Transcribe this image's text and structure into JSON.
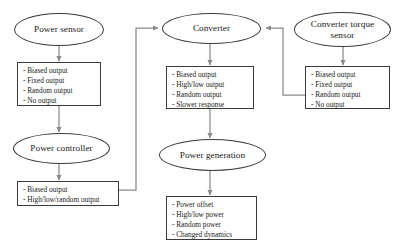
{
  "diagram": {
    "background": "#ffffff",
    "line_color": "#7a7a7a",
    "stroke_color": "#3a3a3a",
    "text_color": "#1a1a1a"
  },
  "nodes": {
    "power_sensor": {
      "label": "Power sensor"
    },
    "converter": {
      "label": "Converter"
    },
    "converter_torque_sensor": {
      "label": "Converter torque\nsensor",
      "line1": "Converter torque",
      "line2": "sensor"
    },
    "power_controller": {
      "label": "Power controller"
    },
    "power_generation": {
      "label": "Power generation"
    }
  },
  "boxes": {
    "power_sensor_faults": {
      "items": [
        "- Biased output",
        "- Fixed output",
        "- Random output",
        "- No output"
      ]
    },
    "converter_faults": {
      "items": [
        "- Biased output",
        "- High/low output",
        "- Random output",
        "- Slower response"
      ]
    },
    "torque_sensor_faults": {
      "items": [
        "- Biased output",
        "- Fixed output",
        "- Random output",
        "- No output"
      ]
    },
    "power_controller_faults": {
      "items": [
        "- Biased output",
        "- High/low/random output"
      ]
    },
    "power_generation_faults": {
      "items": [
        "- Power offset",
        "- High/low power",
        "- Random power",
        "- Changed dynamics"
      ]
    }
  },
  "connectors": [
    {
      "name": "power-sensor-to-faults",
      "kind": "arrow-down"
    },
    {
      "name": "power-sensor-faults-to-power-controller",
      "kind": "arrow-down"
    },
    {
      "name": "power-controller-to-faults",
      "kind": "arrow-down"
    },
    {
      "name": "power-controller-faults-to-converter",
      "kind": "elbow-arrow-right"
    },
    {
      "name": "converter-to-faults",
      "kind": "arrow-down"
    },
    {
      "name": "converter-faults-to-power-generation",
      "kind": "arrow-down"
    },
    {
      "name": "power-generation-to-faults",
      "kind": "arrow-down"
    },
    {
      "name": "torque-sensor-to-faults",
      "kind": "arrow-down"
    },
    {
      "name": "torque-sensor-faults-to-converter",
      "kind": "elbow-arrow-left"
    }
  ]
}
